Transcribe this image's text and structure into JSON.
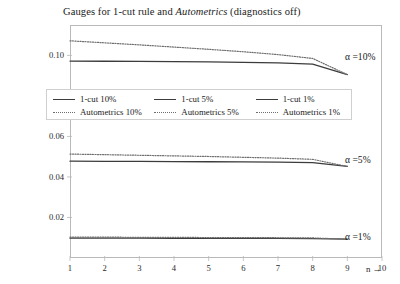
{
  "chart_data": {
    "type": "line",
    "title": "Gauges for 1-cut rule and Autometrics (diagnostics off)",
    "title_parts": {
      "before": "Gauges for 1-cut rule and ",
      "italic": "Autometrics",
      "after": " (diagnostics off)"
    },
    "xlabel": "n →",
    "ylabel": "",
    "xlim": [
      1,
      10
    ],
    "ylim": [
      0,
      0.115
    ],
    "grid": false,
    "legend_position": "upper-left-inside",
    "x": [
      1,
      2,
      3,
      4,
      5,
      6,
      7,
      8,
      9
    ],
    "xticks": [
      1,
      2,
      3,
      4,
      5,
      6,
      7,
      8,
      9,
      10
    ],
    "yticks": [
      0.02,
      0.04,
      0.06,
      0.08,
      0.1
    ],
    "ytick_labels": [
      "0.02",
      "0.04",
      "0.06",
      "0.08",
      "0.10"
    ],
    "series": [
      {
        "name": "1-cut 10%",
        "style": "solid",
        "color": "#3c3c3c",
        "values": [
          0.0972,
          0.0971,
          0.097,
          0.0969,
          0.0968,
          0.0966,
          0.0963,
          0.0957,
          0.0905
        ]
      },
      {
        "name": "1-cut 5%",
        "style": "solid",
        "color": "#3c3c3c",
        "values": [
          0.0478,
          0.0477,
          0.0477,
          0.0476,
          0.0475,
          0.0474,
          0.0473,
          0.0471,
          0.0452
        ]
      },
      {
        "name": "1-cut 1%",
        "style": "solid",
        "color": "#3c3c3c",
        "values": [
          0.0098,
          0.0098,
          0.0098,
          0.0097,
          0.0097,
          0.0097,
          0.0097,
          0.0096,
          0.0093
        ]
      },
      {
        "name": "Autometrics 10%",
        "style": "dotted",
        "color": "#6e6e6e",
        "values": [
          0.1072,
          0.1062,
          0.1052,
          0.1041,
          0.103,
          0.1018,
          0.1004,
          0.0985,
          0.0905
        ]
      },
      {
        "name": "Autometrics 5%",
        "style": "dotted",
        "color": "#6e6e6e",
        "values": [
          0.0513,
          0.051,
          0.0507,
          0.0504,
          0.0501,
          0.0497,
          0.0493,
          0.0487,
          0.0452
        ]
      },
      {
        "name": "Autometrics 1%",
        "style": "dotted",
        "color": "#6e6e6e",
        "values": [
          0.0103,
          0.0103,
          0.0102,
          0.0102,
          0.0101,
          0.0101,
          0.01,
          0.0099,
          0.0093
        ]
      }
    ],
    "annotations": [
      {
        "text": "α =10%",
        "y": 0.0995
      },
      {
        "text": "α =5%",
        "y": 0.049
      },
      {
        "text": "α =1%",
        "y": 0.0108
      }
    ],
    "legend": [
      {
        "label": "1-cut 10%",
        "style": "solid"
      },
      {
        "label": "1-cut 5%",
        "style": "solid"
      },
      {
        "label": "1-cut 1%",
        "style": "solid"
      },
      {
        "label": "Autometrics 10%",
        "style": "dotted"
      },
      {
        "label": "Autometrics 5%",
        "style": "dotted"
      },
      {
        "label": "Autometrics 1%",
        "style": "dotted"
      }
    ]
  }
}
